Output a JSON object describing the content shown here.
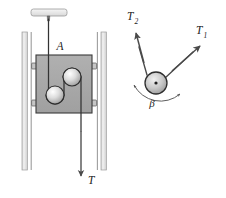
{
  "figure": {
    "labels": {
      "block": "A",
      "tension_cable": "T",
      "tension_1_base": "T",
      "tension_1_sub": "1",
      "tension_2_base": "T",
      "tension_2_sub": "2",
      "angle": "β"
    },
    "colors": {
      "block_fill": "#a8a8a8",
      "block_stroke": "#3a3a3a",
      "rail_fill": "#e8e8e8",
      "rail_stroke": "#8a8a8a",
      "ceiling_fill": "#ededed",
      "ceiling_stroke": "#8f8f8f",
      "pulley_stroke": "#2e2e2e",
      "cable_stroke": "#333333",
      "arrow_stroke": "#4a4a4a",
      "background": "#ffffff",
      "label_color": "#222222"
    },
    "geometry": {
      "block_x": 36,
      "block_y": 55,
      "block_width": 56,
      "block_height": 58,
      "rail_left_x": 22,
      "rail_right_x": 100,
      "rail_top_y": 32,
      "rail_bottom_y": 170,
      "ceiling_plate_x": 31,
      "ceiling_plate_y": 9,
      "ceiling_plate_width": 36,
      "ceiling_plate_height": 7,
      "pulley_upper_cx": 72,
      "pulley_upper_cy": 77,
      "pulley_lower_cx": 55,
      "pulley_lower_cy": 95,
      "pulley_radius": 9,
      "free_pulley_cx": 156,
      "free_pulley_cy": 83,
      "free_pulley_radius": 11,
      "angle_beta_degrees": 105
    },
    "vectors": [
      {
        "name": "T1",
        "angle_label": "up-right",
        "tip_x": 199,
        "tip_y": 47
      },
      {
        "name": "T2",
        "angle_label": "up-left",
        "tip_x": 136,
        "tip_y": 31
      },
      {
        "name": "T",
        "angle_label": "down",
        "tip_x": 78,
        "tip_y": 177
      }
    ]
  }
}
